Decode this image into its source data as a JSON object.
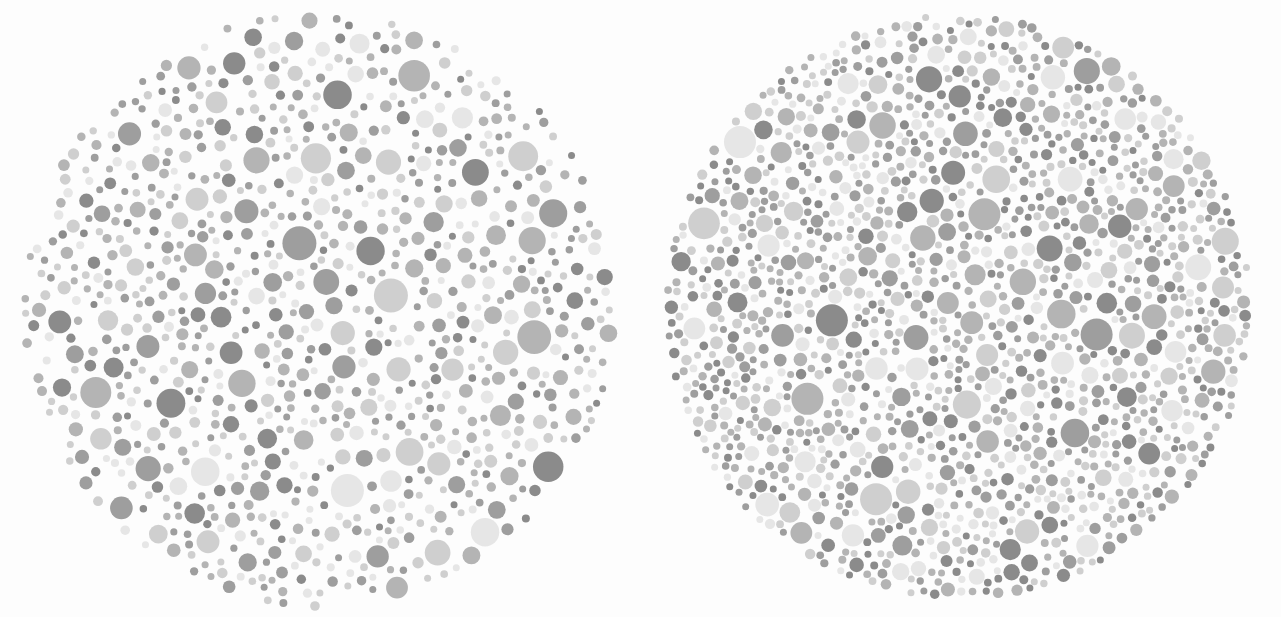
{
  "canvas": {
    "width": 1281,
    "height": 617,
    "background": "#fdfdfd",
    "description": "Two grayscale Ishihara-style pseudoisochromatic color-vision test plates shown side by side"
  },
  "palette": {
    "background": "#fdfdfd",
    "tones": [
      "#8b8b8b",
      "#9e9e9e",
      "#b4b4b4",
      "#cfcfcf",
      "#e6e6e6",
      "#efefef"
    ],
    "darkest": "#8b8b8b",
    "lightest": "#efefef"
  },
  "plates": [
    {
      "name": "left-plate",
      "label": "Plate A",
      "center_x": 318,
      "center_y": 310,
      "radius": 302,
      "density": 0.62,
      "dot_min_diameter": 7,
      "dot_max_diameter": 34,
      "packing": "sparse",
      "seed": 20113,
      "edge_falloff": 0.22,
      "tone_weights": [
        0.14,
        0.2,
        0.26,
        0.24,
        0.16
      ]
    },
    {
      "name": "right-plate",
      "label": "Plate B",
      "center_x": 958,
      "center_y": 307,
      "radius": 296,
      "density": 0.9,
      "dot_min_diameter": 7,
      "dot_max_diameter": 32,
      "packing": "dense",
      "seed": 77321,
      "edge_falloff": 0.04,
      "tone_weights": [
        0.16,
        0.22,
        0.25,
        0.22,
        0.15
      ]
    }
  ],
  "chart_data": {
    "type": "scatter",
    "title": "",
    "xlabel": "",
    "ylabel": "",
    "series": [
      {
        "name": "left-plate-dots",
        "marker": "circle",
        "approx_count": 470,
        "radius_range_px": [
          3.5,
          17
        ],
        "gray_levels": [
          "#8b8b8b",
          "#9e9e9e",
          "#b4b4b4",
          "#cfcfcf",
          "#e6e6e6"
        ]
      },
      {
        "name": "right-plate-dots",
        "marker": "circle",
        "approx_count": 780,
        "radius_range_px": [
          3.5,
          16
        ],
        "gray_levels": [
          "#8b8b8b",
          "#9e9e9e",
          "#b4b4b4",
          "#cfcfcf",
          "#e6e6e6"
        ]
      }
    ],
    "xlim": [
      0,
      1281
    ],
    "ylim": [
      0,
      617
    ],
    "grid": false,
    "legend": "none"
  }
}
